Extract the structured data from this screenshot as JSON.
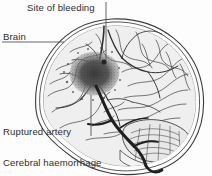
{
  "figure": {
    "caption": "Cerebral haemorrhage",
    "background_color": "#fdfdfd",
    "text_color": "#2e2e2e",
    "leader_line_color": "#555555",
    "ink_color": "#333333",
    "brain_fill_color": "#efefef",
    "haemorrhage_color": "#4a4a4a",
    "artery_color": "#2b2b2b"
  },
  "labels": {
    "site_of_bleeding": "Site of bleeding",
    "brain": "Brain",
    "ruptured_artery": "Ruptured artery",
    "cerebral_haemorrhage": "Cerebral haemorrhage"
  },
  "illustration": {
    "subject": "sagittal-view-of-head-showing-cerebral-haemorrhage",
    "parts": [
      "skull-outline",
      "cerebrum-gyri",
      "cerebellum",
      "haemorrhage-blob",
      "ruptured-artery",
      "cerebral-arteries"
    ]
  },
  "leaders": {
    "site_of_bleeding": "vertical-line-down-to-haemorrhage",
    "brain": "horizontal-line-right-to-cerebrum",
    "ruptured_artery": "vertical-line-up-to-artery"
  }
}
